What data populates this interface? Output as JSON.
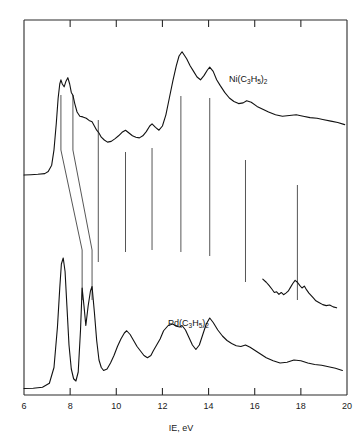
{
  "figure": {
    "background": "#ffffff",
    "line_color": "#111111",
    "frame_color": "#2b2b2b"
  },
  "axis": {
    "x_label": "IE, eV",
    "x_ticks": [
      6,
      8,
      10,
      12,
      14,
      16,
      18,
      20
    ],
    "x_tick_labels": [
      "6",
      "8",
      "10",
      "12",
      "14",
      "16",
      "18",
      "20"
    ],
    "x_min": 6,
    "x_max": 20
  },
  "series_labels": {
    "top": {
      "prefix": "Ni(C",
      "sub1": "3",
      "mid": "H",
      "sub2": "5",
      "suffix": ")",
      "sub3": "2",
      "full": "Ni(C3H5)2"
    },
    "bottom": {
      "prefix": "Pd(C",
      "sub1": "3",
      "mid": "H",
      "sub2": "5",
      "suffix": ")",
      "sub3": "2",
      "full": "Pd(C3H5)2"
    }
  },
  "chart_data": {
    "type": "line",
    "title": "",
    "subtitle": "",
    "xlabel": "IE, eV",
    "ylabel": "",
    "xlim": [
      6,
      20
    ],
    "ylim": [
      0,
      1
    ],
    "grid": false,
    "legend": "inline-annotation",
    "annotations": [
      {
        "text": "Ni(C3H5)2",
        "x": 15.0,
        "y": 0.8
      },
      {
        "text": "Pd(C3H5)2",
        "x": 12.4,
        "y": 0.26
      }
    ],
    "correlation_lines": {
      "description": "Tie lines linking corresponding bands of the two spectra",
      "slanted": [
        {
          "top_x": 7.6,
          "bottom_x": 8.52
        },
        {
          "top_x": 8.12,
          "bottom_x": 8.95
        }
      ],
      "vertical_x": [
        9.22,
        10.4,
        11.55,
        12.8,
        14.05,
        15.6,
        17.85
      ]
    },
    "series": [
      {
        "name": "Ni(C3H5)2",
        "offset": "upper trace",
        "peaks_ev": [
          7.6,
          8.12,
          9.25,
          10.4,
          11.55,
          12.85,
          14.05,
          15.65,
          17.9
        ],
        "x": [
          6.0,
          6.3,
          6.6,
          6.9,
          7.05,
          7.2,
          7.3,
          7.4,
          7.48,
          7.55,
          7.6,
          7.66,
          7.74,
          7.82,
          7.9,
          7.98,
          8.05,
          8.12,
          8.2,
          8.3,
          8.42,
          8.55,
          8.7,
          8.82,
          8.95,
          9.05,
          9.15,
          9.25,
          9.35,
          9.48,
          9.62,
          9.78,
          9.95,
          10.1,
          10.25,
          10.4,
          10.55,
          10.7,
          10.85,
          11.0,
          11.15,
          11.3,
          11.45,
          11.55,
          11.7,
          11.85,
          12.0,
          12.15,
          12.3,
          12.45,
          12.6,
          12.72,
          12.85,
          12.95,
          13.05,
          13.2,
          13.35,
          13.5,
          13.65,
          13.8,
          13.95,
          14.05,
          14.2,
          14.35,
          14.5,
          14.7,
          14.9,
          15.1,
          15.3,
          15.5,
          15.65,
          15.85,
          16.1,
          16.35,
          16.6,
          16.9,
          17.2,
          17.5,
          17.8,
          18.1,
          18.4,
          18.7,
          19.0,
          19.3,
          19.6,
          19.9
        ],
        "y": [
          0.05,
          0.052,
          0.055,
          0.06,
          0.075,
          0.12,
          0.23,
          0.42,
          0.6,
          0.7,
          0.73,
          0.7,
          0.68,
          0.72,
          0.745,
          0.7,
          0.64,
          0.62,
          0.56,
          0.5,
          0.47,
          0.465,
          0.455,
          0.44,
          0.43,
          0.4,
          0.37,
          0.35,
          0.32,
          0.3,
          0.285,
          0.29,
          0.31,
          0.33,
          0.355,
          0.37,
          0.35,
          0.33,
          0.32,
          0.315,
          0.33,
          0.36,
          0.4,
          0.415,
          0.39,
          0.37,
          0.4,
          0.48,
          0.6,
          0.72,
          0.83,
          0.9,
          0.93,
          0.905,
          0.88,
          0.83,
          0.79,
          0.75,
          0.73,
          0.76,
          0.8,
          0.82,
          0.79,
          0.73,
          0.69,
          0.64,
          0.6,
          0.575,
          0.56,
          0.565,
          0.58,
          0.57,
          0.54,
          0.52,
          0.5,
          0.48,
          0.47,
          0.475,
          0.48,
          0.47,
          0.46,
          0.455,
          0.445,
          0.435,
          0.425,
          0.41
        ]
      },
      {
        "name": "Pd(C3H5)2",
        "offset": "lower trace",
        "peaks_ev": [
          7.7,
          8.55,
          8.95,
          9.3,
          10.45,
          11.6,
          12.85,
          14.1,
          15.7,
          17.9
        ],
        "x": [
          6.0,
          6.4,
          6.8,
          7.1,
          7.3,
          7.45,
          7.55,
          7.62,
          7.7,
          7.78,
          7.86,
          7.95,
          8.05,
          8.15,
          8.25,
          8.35,
          8.45,
          8.52,
          8.6,
          8.68,
          8.78,
          8.88,
          8.95,
          9.05,
          9.15,
          9.25,
          9.35,
          9.45,
          9.6,
          9.75,
          9.9,
          10.05,
          10.2,
          10.35,
          10.45,
          10.6,
          10.75,
          10.9,
          11.05,
          11.2,
          11.35,
          11.5,
          11.6,
          11.75,
          11.9,
          12.05,
          12.25,
          12.45,
          12.6,
          12.75,
          12.85,
          13.0,
          13.15,
          13.3,
          13.45,
          13.6,
          13.75,
          13.9,
          14.05,
          14.2,
          14.4,
          14.6,
          14.8,
          15.0,
          15.2,
          15.4,
          15.6,
          15.8,
          16.0,
          16.25,
          16.5,
          16.8,
          17.1,
          17.4,
          17.7,
          18.0,
          18.3,
          18.6,
          18.9,
          19.2,
          19.5,
          19.8
        ],
        "y": [
          0.01,
          0.012,
          0.018,
          0.045,
          0.15,
          0.42,
          0.68,
          0.84,
          0.88,
          0.79,
          0.56,
          0.3,
          0.14,
          0.075,
          0.06,
          0.12,
          0.4,
          0.68,
          0.56,
          0.43,
          0.56,
          0.66,
          0.69,
          0.52,
          0.33,
          0.2,
          0.15,
          0.13,
          0.14,
          0.18,
          0.23,
          0.29,
          0.34,
          0.38,
          0.395,
          0.37,
          0.33,
          0.29,
          0.26,
          0.23,
          0.215,
          0.23,
          0.26,
          0.3,
          0.34,
          0.395,
          0.43,
          0.44,
          0.425,
          0.42,
          0.43,
          0.4,
          0.35,
          0.3,
          0.27,
          0.3,
          0.37,
          0.44,
          0.48,
          0.45,
          0.4,
          0.36,
          0.33,
          0.31,
          0.295,
          0.29,
          0.3,
          0.285,
          0.265,
          0.24,
          0.215,
          0.195,
          0.18,
          0.185,
          0.2,
          0.195,
          0.18,
          0.17,
          0.165,
          0.155,
          0.145,
          0.13
        ]
      },
      {
        "name": "Pd expanded inset",
        "offset": "inset trace (high IE region, vertically expanded)",
        "x": [
          16.35,
          16.5,
          16.62,
          16.75,
          16.85,
          16.95,
          17.05,
          17.15,
          17.25,
          17.35,
          17.45,
          17.55,
          17.65,
          17.75,
          17.85,
          17.95,
          18.05,
          18.15,
          18.25,
          18.35,
          18.45,
          18.55,
          18.65,
          18.8,
          18.95,
          19.1,
          19.25,
          19.4,
          19.55
        ],
        "y": [
          0.64,
          0.59,
          0.54,
          0.48,
          0.43,
          0.44,
          0.4,
          0.43,
          0.395,
          0.42,
          0.45,
          0.51,
          0.57,
          0.62,
          0.59,
          0.54,
          0.5,
          0.53,
          0.47,
          0.42,
          0.38,
          0.34,
          0.3,
          0.27,
          0.24,
          0.225,
          0.235,
          0.205,
          0.19
        ]
      }
    ]
  }
}
